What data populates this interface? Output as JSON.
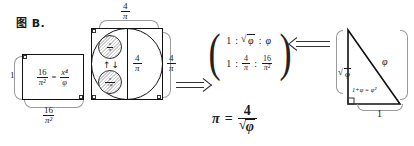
{
  "figure": {
    "caption": "图 B."
  },
  "left_rectangle": {
    "lhs": {
      "num": "16",
      "den": "π²"
    },
    "equals": "=",
    "rhs": {
      "num": "x⁴",
      "den": "φ"
    },
    "label_left": "1",
    "label_bottom": {
      "num": "16",
      "den": "π²"
    }
  },
  "square_circle": {
    "label_top": {
      "num": "4",
      "den": "π"
    },
    "label_middle": {
      "num": "4",
      "den": "π"
    },
    "label_right": {
      "num": "4",
      "den": "π"
    },
    "mini_circle_top": {
      "num": "x",
      "den": "π"
    },
    "mini_circle_bottom": {
      "num": "x",
      "den": "√φ"
    },
    "arrows": "↑↓"
  },
  "ratio": {
    "row1": {
      "a": "1",
      "b": "φ",
      "b_radical": true,
      "c": "φ"
    },
    "row2": {
      "a": "1",
      "b": {
        "num": "4",
        "den": "π"
      },
      "c": {
        "num": "16",
        "den": "π²"
      }
    },
    "separator": ":"
  },
  "pi_formula": {
    "symbol": "π",
    "equals": "=",
    "num": "4",
    "den_radicand": "φ"
  },
  "triangle": {
    "hypotenuse_label": "φ",
    "vertical_label": "φ",
    "vertical_is_sqrt": true,
    "base_label": "1",
    "inner_label": "1+φ = φ²"
  },
  "colors": {
    "ink": "#1a1a1a",
    "guide": "#9a9a9a",
    "background": "#ffffff"
  }
}
